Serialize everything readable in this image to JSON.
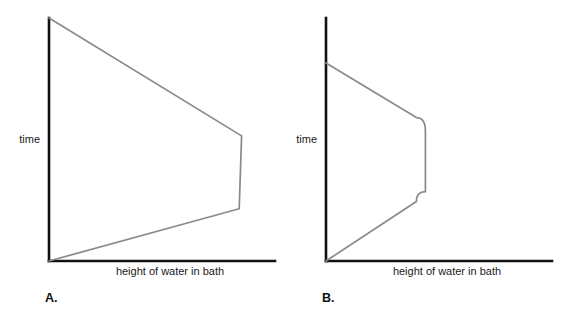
{
  "figure": {
    "background_color": "#ffffff",
    "axis_color": "#111111",
    "curve_color": "#8a8a8a",
    "panels": [
      {
        "letter": "A.",
        "y_axis_label": "time",
        "x_axis_label": "height of water in bath"
      },
      {
        "letter": "B.",
        "y_axis_label": "time",
        "x_axis_label": "height of water in bath"
      }
    ]
  },
  "chart_data": [
    {
      "type": "line",
      "title": "A.",
      "xlabel": "height of water in bath",
      "ylabel": "time",
      "grid": false,
      "legend": "none",
      "axis_ticks": [],
      "note": "Closed outline: from origin (time 0, height 0) the height rises steadily to a maximum, holds at that maximum while time passes, then falls steadily back toward zero at the top of the time axis. Corners are sharp/angular.",
      "series": [
        {
          "name": "bath water outline A",
          "points": [
            [
              0.0,
              0.0
            ],
            [
              0.82,
              0.215
            ],
            [
              0.83,
              0.515
            ],
            [
              0.0,
              1.0
            ]
          ]
        }
      ],
      "xlim": [
        0,
        1
      ],
      "ylim": [
        0,
        1
      ]
    },
    {
      "type": "line",
      "title": "B.",
      "xlabel": "height of water in bath",
      "ylabel": "time",
      "grid": false,
      "legend": "none",
      "axis_ticks": [],
      "note": "Closed outline narrower than A: height rises to a maximum, holds at that maximum, then falls back to zero. Shoulders where the rise and fall meet the flat maximum are rounded rather than sharp.",
      "series": [
        {
          "name": "bath water outline B",
          "points": [
            [
              0.0,
              0.0
            ],
            [
              0.4,
              0.245
            ],
            [
              0.44,
              0.285
            ],
            [
              0.44,
              0.535
            ],
            [
              0.4,
              0.59
            ],
            [
              0.0,
              0.815
            ]
          ]
        }
      ],
      "xlim": [
        0,
        1
      ],
      "ylim": [
        0,
        1
      ]
    }
  ]
}
